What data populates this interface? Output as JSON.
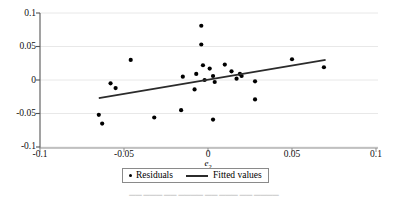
{
  "figure": {
    "background_color": "#ffffff"
  },
  "axes": {
    "x_title": "e",
    "x_title_sub": "2",
    "x_ticks": [
      "-0.1",
      "-0.05",
      "0",
      "0.05",
      "0.1"
    ],
    "y_ticks": [
      "0.1",
      "0.05",
      "0",
      "-0.05",
      "-0.1"
    ]
  },
  "legend": {
    "entries": [
      {
        "label": "Residuals",
        "marker": "scatter-dot-icon"
      },
      {
        "label": "Fitted values",
        "marker": "fit-line-icon"
      }
    ]
  },
  "caption": {
    "text": "▁▁ ▁▁▁ ▁▁ ▁▁▁▁ ▁▁ ▁▁▁ ▁▁ ▁▁▁▁"
  },
  "chart_data": {
    "type": "scatter",
    "title": "",
    "xlabel": "e2",
    "ylabel": "",
    "xlim": [
      -0.1,
      0.1
    ],
    "ylim": [
      -0.1,
      0.1
    ],
    "xticks": [
      -0.1,
      -0.05,
      0,
      0.05,
      0.1
    ],
    "yticks": [
      -0.1,
      -0.05,
      0,
      0.05,
      0.1
    ],
    "grid": "horizontal",
    "grid_color": "#e8e8e8",
    "marker_color": "#000000",
    "line_color": "#2b2b2b",
    "legend_position": "bottom-center",
    "series": [
      {
        "name": "Residuals",
        "type": "scatter",
        "points": [
          [
            -0.065,
            -0.052
          ],
          [
            -0.063,
            -0.065
          ],
          [
            -0.058,
            -0.005
          ],
          [
            -0.055,
            -0.012
          ],
          [
            -0.046,
            0.03
          ],
          [
            -0.032,
            -0.056
          ],
          [
            -0.016,
            -0.045
          ],
          [
            -0.015,
            0.005
          ],
          [
            -0.008,
            -0.014
          ],
          [
            -0.007,
            0.009
          ],
          [
            -0.004,
            0.081
          ],
          [
            -0.004,
            0.053
          ],
          [
            -0.003,
            0.022
          ],
          [
            -0.002,
            0.0
          ],
          [
            0.001,
            0.017
          ],
          [
            0.003,
            0.006
          ],
          [
            0.004,
            -0.003
          ],
          [
            0.003,
            -0.059
          ],
          [
            0.01,
            0.023
          ],
          [
            0.014,
            0.013
          ],
          [
            0.017,
            0.002
          ],
          [
            0.019,
            0.009
          ],
          [
            0.02,
            0.006
          ],
          [
            0.028,
            -0.002
          ],
          [
            0.028,
            -0.029
          ],
          [
            0.05,
            0.031
          ],
          [
            0.069,
            0.019
          ]
        ]
      },
      {
        "name": "Fitted values",
        "type": "line",
        "points": [
          [
            -0.065,
            -0.027
          ],
          [
            0.07,
            0.03
          ]
        ]
      }
    ]
  }
}
